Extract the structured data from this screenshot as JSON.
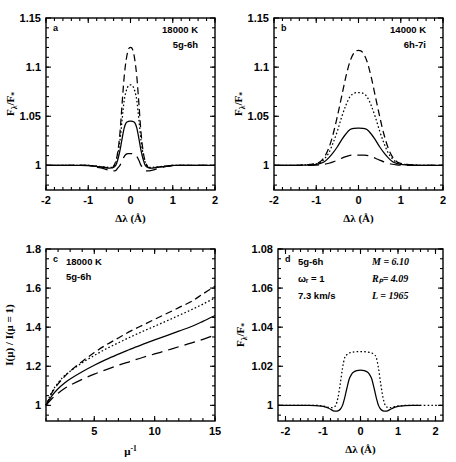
{
  "figure": {
    "name": "four-panel-line-emission-figure",
    "width": 456,
    "height": 462,
    "background": "#ffffff",
    "ink": "#000000"
  },
  "panels": [
    {
      "id": "a",
      "label": "a",
      "annotations": [
        "18000 K",
        "5g-6h"
      ],
      "xlabel": "Δλ (Å)",
      "ylabel": "Fλ/F*",
      "xticks": [
        -2,
        -1,
        0,
        1,
        2
      ],
      "xticklabels": [
        "-2",
        "-1",
        "0",
        "1",
        "2"
      ],
      "yticks": [
        1,
        1.05,
        1.1,
        1.15
      ],
      "yticklabels": [
        "1",
        "1.05",
        "1.1",
        "1.15"
      ],
      "xlim": [
        -2,
        2
      ],
      "ylim": [
        0.975,
        1.15
      ]
    },
    {
      "id": "b",
      "label": "b",
      "annotations": [
        "14000 K",
        "6h-7i"
      ],
      "xlabel": "Δλ (Å)",
      "ylabel": "Fλ/F*",
      "xticks": [
        -2,
        -1,
        0,
        1,
        2
      ],
      "xticklabels": [
        "-2",
        "-1",
        "0",
        "1",
        "2"
      ],
      "yticks": [
        1,
        1.05,
        1.1,
        1.15
      ],
      "yticklabels": [
        "1",
        "1.05",
        "1.1",
        "1.15"
      ],
      "xlim": [
        -2,
        2
      ],
      "ylim": [
        0.975,
        1.15
      ]
    },
    {
      "id": "c",
      "label": "c",
      "annotations": [
        "18000 K",
        "5g-6h"
      ],
      "xlabel": "μ⁻¹",
      "ylabel": "I(μ) / I(μ = 1)",
      "xticks": [
        5,
        10,
        15
      ],
      "xticklabels": [
        "5",
        "10",
        "15"
      ],
      "yticks": [
        1,
        1.2,
        1.4,
        1.6,
        1.8
      ],
      "yticklabels": [
        "1",
        "1.2",
        "1.4",
        "1.6",
        "1.8"
      ],
      "xlim": [
        1,
        15
      ],
      "ylim": [
        0.92,
        1.8
      ]
    },
    {
      "id": "d",
      "label": "d",
      "annotations_left": [
        "5g-6h",
        "ωᵣ = 1",
        "7.3 km/s"
      ],
      "annotations_right": [
        "M = 6.10",
        "Rₚ= 4.09",
        "L = 1965"
      ],
      "xlabel": "Δλ (Å)",
      "ylabel": "Fλ/F*",
      "xticks": [
        -2,
        -1,
        0,
        1,
        2
      ],
      "xticklabels": [
        "-2",
        "-1",
        "0",
        "1",
        "2"
      ],
      "yticks": [
        1,
        1.02,
        1.04,
        1.06,
        1.08
      ],
      "yticklabels": [
        "1",
        "1.02",
        "1.04",
        "1.06",
        "1.08"
      ],
      "xlim": [
        -2.2,
        2.2
      ],
      "ylim": [
        0.992,
        1.08
      ]
    }
  ],
  "chart_data": [
    {
      "type": "line",
      "panel": "a",
      "title": "",
      "xlabel": "Δλ (Å)",
      "ylabel": "Fλ/F*",
      "xlim": [
        -2,
        2
      ],
      "ylim": [
        0.975,
        1.15
      ],
      "grid": false,
      "legend": "none",
      "annotations": [
        "18000 K",
        "5g-6h"
      ],
      "x": [
        -2.0,
        -1.75,
        -1.5,
        -1.25,
        -1.0,
        -0.9,
        -0.8,
        -0.7,
        -0.6,
        -0.5,
        -0.42,
        -0.35,
        -0.3,
        -0.25,
        -0.2,
        -0.15,
        -0.1,
        -0.05,
        0.0,
        0.05,
        0.1,
        0.15,
        0.2,
        0.25,
        0.3,
        0.35,
        0.42,
        0.5,
        0.6,
        0.7,
        0.8,
        0.9,
        1.0,
        1.25,
        1.5,
        1.75,
        2.0
      ],
      "series": [
        {
          "name": "dashed",
          "style": "dashed",
          "peak": 1.12,
          "values": [
            1.0,
            1.0,
            1.0,
            1.0,
            1.0,
            0.9995,
            0.999,
            0.9985,
            0.998,
            0.9975,
            0.998,
            1.004,
            1.014,
            1.033,
            1.062,
            1.09,
            1.108,
            1.118,
            1.12,
            1.118,
            1.108,
            1.09,
            1.062,
            1.033,
            1.014,
            1.004,
            0.998,
            0.9975,
            0.998,
            0.9985,
            0.999,
            0.9995,
            1.0,
            1.0,
            1.0,
            1.0,
            1.0
          ]
        },
        {
          "name": "dotted",
          "style": "dotted",
          "peak": 1.082,
          "values": [
            1.0,
            1.0,
            1.0,
            1.0,
            1.0,
            0.9996,
            0.9992,
            0.9988,
            0.9984,
            0.998,
            0.9985,
            1.003,
            1.011,
            1.025,
            1.046,
            1.066,
            1.076,
            1.081,
            1.082,
            1.081,
            1.076,
            1.066,
            1.046,
            1.025,
            1.011,
            1.003,
            0.9985,
            0.998,
            0.9984,
            0.9988,
            0.9992,
            0.9996,
            1.0,
            1.0,
            1.0,
            1.0,
            1.0
          ]
        },
        {
          "name": "solid",
          "style": "solid",
          "peak": 1.045,
          "values": [
            1.0,
            1.0,
            1.0,
            1.0,
            1.0,
            0.9994,
            0.999,
            0.9984,
            0.9978,
            0.9972,
            0.9976,
            1.0,
            1.006,
            1.015,
            1.027,
            1.038,
            1.0435,
            1.0448,
            1.045,
            1.0448,
            1.0435,
            1.038,
            1.027,
            1.015,
            1.006,
            1.0,
            0.9976,
            0.9972,
            0.9978,
            0.9984,
            0.999,
            0.9994,
            1.0,
            1.0,
            1.0,
            1.0,
            1.0
          ]
        },
        {
          "name": "long-dashed",
          "style": "longdash",
          "peak": 1.012,
          "values": [
            1.0,
            1.0,
            1.0,
            1.0,
            0.9998,
            0.9992,
            0.9984,
            0.9974,
            0.9962,
            0.995,
            0.9944,
            0.9948,
            0.9975,
            1.0,
            1.005,
            1.009,
            1.0115,
            1.012,
            1.012,
            1.012,
            1.0115,
            1.009,
            1.005,
            1.0,
            0.9975,
            0.9948,
            0.9944,
            0.995,
            0.9962,
            0.9974,
            0.9984,
            0.9992,
            0.9998,
            1.0,
            1.0,
            1.0,
            1.0
          ]
        }
      ]
    },
    {
      "type": "line",
      "panel": "b",
      "title": "",
      "xlabel": "Δλ (Å)",
      "ylabel": "Fλ/F*",
      "xlim": [
        -2,
        2
      ],
      "ylim": [
        0.975,
        1.15
      ],
      "grid": false,
      "legend": "none",
      "annotations": [
        "14000 K",
        "6h-7i"
      ],
      "x": [
        -2.0,
        -1.75,
        -1.5,
        -1.3,
        -1.15,
        -1.0,
        -0.9,
        -0.8,
        -0.7,
        -0.6,
        -0.5,
        -0.4,
        -0.3,
        -0.2,
        -0.1,
        0.0,
        0.1,
        0.2,
        0.3,
        0.4,
        0.5,
        0.6,
        0.7,
        0.8,
        0.9,
        1.0,
        1.15,
        1.3,
        1.5,
        1.75,
        2.0
      ],
      "series": [
        {
          "name": "dashed",
          "style": "dashed",
          "peak": 1.117,
          "values": [
            1.0,
            1.0,
            1.0,
            1.0005,
            1.001,
            1.002,
            1.004,
            1.009,
            1.018,
            1.032,
            1.05,
            1.07,
            1.09,
            1.106,
            1.115,
            1.117,
            1.115,
            1.106,
            1.09,
            1.07,
            1.05,
            1.032,
            1.018,
            1.009,
            1.004,
            1.002,
            1.001,
            1.0005,
            1.0,
            1.0,
            1.0
          ]
        },
        {
          "name": "dotted",
          "style": "dotted",
          "peak": 1.074,
          "values": [
            1.0,
            1.0,
            1.0,
            1.0004,
            1.0008,
            1.0016,
            1.003,
            1.007,
            1.013,
            1.023,
            1.035,
            1.049,
            1.061,
            1.07,
            1.0735,
            1.074,
            1.0735,
            1.07,
            1.061,
            1.049,
            1.035,
            1.023,
            1.013,
            1.007,
            1.003,
            1.0016,
            1.0008,
            1.0004,
            1.0,
            1.0,
            1.0
          ]
        },
        {
          "name": "solid",
          "style": "solid",
          "peak": 1.038,
          "values": [
            1.0,
            1.0,
            1.0,
            1.0002,
            1.0005,
            1.001,
            1.002,
            1.004,
            1.008,
            1.013,
            1.019,
            1.026,
            1.032,
            1.0365,
            1.0378,
            1.038,
            1.0378,
            1.0365,
            1.032,
            1.026,
            1.019,
            1.013,
            1.008,
            1.004,
            1.002,
            1.001,
            1.0005,
            1.0002,
            1.0,
            1.0,
            1.0
          ]
        },
        {
          "name": "long-dashed",
          "style": "longdash",
          "peak": 1.0105,
          "values": [
            1.0,
            1.0,
            1.0,
            1.0,
            1.0001,
            1.0003,
            1.0006,
            1.0012,
            1.0022,
            1.0036,
            1.0054,
            1.0073,
            1.009,
            1.0102,
            1.0105,
            1.0105,
            1.0105,
            1.0102,
            1.009,
            1.0073,
            1.0054,
            1.0036,
            1.0022,
            1.0012,
            1.0006,
            1.0003,
            1.0001,
            1.0,
            1.0,
            1.0,
            1.0
          ]
        }
      ]
    },
    {
      "type": "line",
      "panel": "c",
      "title": "",
      "xlabel": "μ⁻¹",
      "ylabel": "I(μ) / I(μ = 1)",
      "xlim": [
        1,
        15
      ],
      "ylim": [
        0.92,
        1.8
      ],
      "grid": false,
      "legend": "none",
      "annotations": [
        "18000 K",
        "5g-6h"
      ],
      "x": [
        1,
        1.5,
        2,
        2.5,
        3,
        4,
        5,
        6,
        7,
        8,
        9,
        10,
        11,
        12,
        13,
        14,
        15
      ],
      "series": [
        {
          "name": "dashed",
          "style": "dashed",
          "end": 1.61,
          "values": [
            1.0,
            1.065,
            1.11,
            1.145,
            1.175,
            1.225,
            1.27,
            1.31,
            1.345,
            1.38,
            1.41,
            1.44,
            1.47,
            1.5,
            1.53,
            1.57,
            1.61
          ]
        },
        {
          "name": "dotted",
          "style": "dotted",
          "end": 1.55,
          "values": [
            1.0,
            1.07,
            1.115,
            1.15,
            1.175,
            1.218,
            1.255,
            1.29,
            1.32,
            1.35,
            1.378,
            1.405,
            1.432,
            1.46,
            1.488,
            1.518,
            1.55
          ]
        },
        {
          "name": "solid",
          "style": "solid",
          "end": 1.46,
          "values": [
            1.0,
            1.05,
            1.085,
            1.112,
            1.135,
            1.172,
            1.205,
            1.235,
            1.262,
            1.288,
            1.312,
            1.335,
            1.357,
            1.38,
            1.402,
            1.43,
            1.46
          ]
        },
        {
          "name": "long-dashed",
          "style": "longdash",
          "end": 1.36,
          "values": [
            1.0,
            1.035,
            1.062,
            1.085,
            1.103,
            1.133,
            1.16,
            1.183,
            1.205,
            1.225,
            1.245,
            1.263,
            1.281,
            1.3,
            1.318,
            1.338,
            1.36
          ]
        }
      ]
    },
    {
      "type": "line",
      "panel": "d",
      "title": "",
      "xlabel": "Δλ (Å)",
      "ylabel": "Fλ/F*",
      "xlim": [
        -2.2,
        2.2
      ],
      "ylim": [
        0.992,
        1.08
      ],
      "grid": false,
      "legend": "none",
      "annotations_left": [
        "5g-6h",
        "ωᵣ = 1",
        "7.3 km/s"
      ],
      "annotations_right": [
        "M = 6.10",
        "Rₚ= 4.09",
        "L = 1965"
      ],
      "x": [
        -2.2,
        -1.9,
        -1.6,
        -1.4,
        -1.2,
        -1.05,
        -0.95,
        -0.85,
        -0.78,
        -0.72,
        -0.66,
        -0.6,
        -0.54,
        -0.48,
        -0.42,
        -0.36,
        -0.3,
        -0.25,
        -0.2,
        -0.1,
        0.0,
        0.1,
        0.2,
        0.25,
        0.3,
        0.36,
        0.42,
        0.48,
        0.54,
        0.6,
        0.66,
        0.72,
        0.78,
        0.85,
        0.95,
        1.05,
        1.2,
        1.4,
        1.6,
        1.9,
        2.2
      ],
      "series": [
        {
          "name": "dotted",
          "style": "dotted",
          "peak": 1.027,
          "values": [
            1.0,
            1.0,
            1.0,
            1.0,
            1.0,
            0.9998,
            0.9995,
            0.999,
            0.9988,
            0.999,
            1.0,
            1.004,
            1.011,
            1.019,
            1.0245,
            1.026,
            1.0268,
            1.027,
            1.0272,
            1.0275,
            1.0275,
            1.0275,
            1.0272,
            1.027,
            1.0268,
            1.026,
            1.0245,
            1.019,
            1.011,
            1.004,
            1.0,
            0.999,
            0.9988,
            0.999,
            0.9995,
            0.9998,
            1.0,
            1.0,
            1.0,
            1.0,
            1.0
          ]
        },
        {
          "name": "solid",
          "style": "solid",
          "peak": 1.018,
          "values": [
            1.0,
            1.0,
            1.0,
            1.0,
            0.9999,
            0.9996,
            0.9992,
            0.9985,
            0.9978,
            0.9972,
            0.997,
            0.9972,
            0.998,
            1.0,
            1.004,
            1.009,
            1.0135,
            1.0155,
            1.0168,
            1.0178,
            1.018,
            1.0178,
            1.0168,
            1.0155,
            1.0135,
            1.009,
            1.004,
            1.0,
            0.998,
            0.9972,
            0.997,
            0.9972,
            0.9978,
            0.9985,
            0.9992,
            0.9996,
            0.9999,
            1.0,
            1.0,
            1.0
          ]
        }
      ]
    }
  ]
}
